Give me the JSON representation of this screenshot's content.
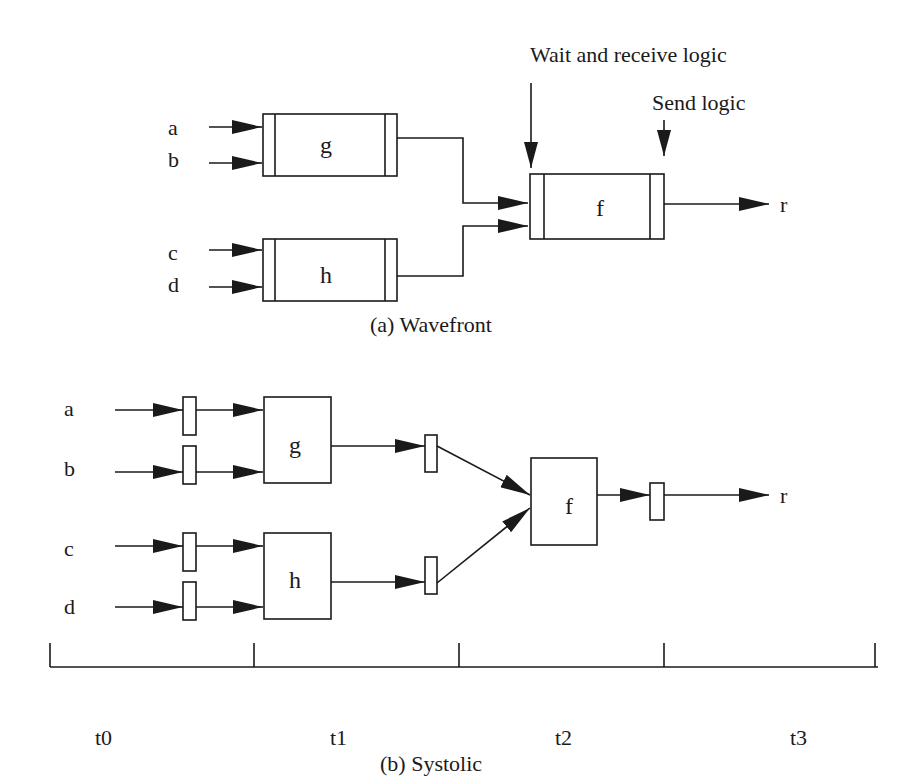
{
  "wavefront": {
    "caption": "(a) Wavefront",
    "inputs": [
      "a",
      "b",
      "c",
      "d"
    ],
    "nodes": {
      "g": "g",
      "h": "h",
      "f": "f"
    },
    "output": "r",
    "annotations": {
      "wait_receive": "Wait and receive logic",
      "send": "Send logic"
    }
  },
  "systolic": {
    "caption": "(b) Systolic",
    "inputs": [
      "a",
      "b",
      "c",
      "d"
    ],
    "nodes": {
      "g": "g",
      "h": "h",
      "f": "f"
    },
    "output": "r",
    "time_steps": [
      "t0",
      "t1",
      "t2",
      "t3"
    ]
  },
  "colors": {
    "ink": "#1a1a1a",
    "background": "#ffffff"
  }
}
